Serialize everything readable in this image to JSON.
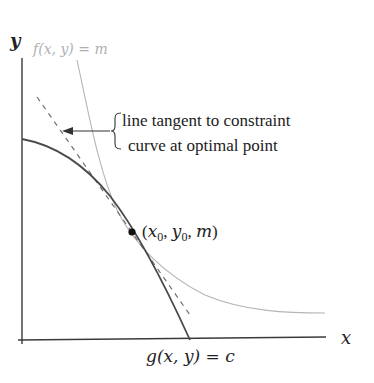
{
  "diagram": {
    "type": "lagrange-multiplier-illustration",
    "labels": {
      "y_axis": "y",
      "x_axis": "x",
      "level_curve": "f(x, y) = m",
      "constraint_curve": "g(x, y) = c",
      "tangent_annotation_line1": "line tangent to constraint",
      "tangent_annotation_line2": "curve at optimal point",
      "point_label_open": "(",
      "point_label_x": "x",
      "point_label_x_sub": "0",
      "point_label_sep1": ", ",
      "point_label_y": "y",
      "point_label_y_sub": "0",
      "point_label_sep2": ", ",
      "point_label_m": "m",
      "point_label_close": ")"
    },
    "colors": {
      "axis": "#3a3a3a",
      "constraint_curve": "#4a4a4a",
      "level_curve": "#b5b5b5",
      "level_label": "#b0b0b0",
      "tangent_line": "#707070",
      "text": "#222222",
      "point": "#111111"
    },
    "optimal_point": {
      "x": 132,
      "y": 232
    }
  }
}
